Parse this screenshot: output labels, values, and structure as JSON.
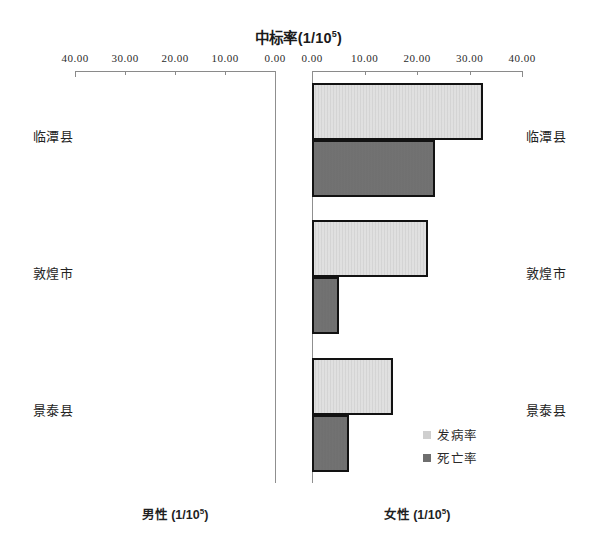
{
  "chart_data": {
    "type": "bar",
    "orientation": "horizontal",
    "layout": "back-to-back population pyramid (two mirrored panels)",
    "title_plain": "中标率(1/10^5)",
    "xlabel_left": "男性 (1/10⁵)",
    "xlabel_right": "女性 (1/10⁵)",
    "ylabel": "",
    "categories": [
      "临潭县",
      "敦煌市",
      "景泰县"
    ],
    "legend": [
      "发病率",
      "死亡率"
    ],
    "legend_position": "inside right, lower area",
    "grid": false,
    "xlim_left": [
      40.0,
      0.0
    ],
    "xlim_right": [
      0.0,
      40.0
    ],
    "tick_labels_left": [
      "40.00",
      "30.00",
      "20.00",
      "10.00",
      "0.00"
    ],
    "tick_labels_right": [
      "0.00",
      "10.00",
      "20.00",
      "30.00",
      "40.00"
    ],
    "tick_values": [
      0,
      10,
      20,
      30,
      40
    ],
    "panels": [
      {
        "name": "男性",
        "series": [
          {
            "name": "发病率",
            "values": [
              0,
              0,
              0
            ]
          },
          {
            "name": "死亡率",
            "values": [
              0,
              0,
              0
            ]
          }
        ]
      },
      {
        "name": "女性",
        "series": [
          {
            "name": "发病率",
            "values": [
              32.5,
              22.0,
              15.4
            ]
          },
          {
            "name": "死亡率",
            "values": [
              23.5,
              5.1,
              7.0
            ]
          }
        ]
      }
    ]
  },
  "title": {
    "main": "中标率(1/10",
    "sup": "5",
    "tail": ")"
  },
  "captions": {
    "left": {
      "text": "男性  (1/10",
      "sup": "5",
      "tail": ")"
    },
    "right": {
      "text": "女性  (1/10",
      "sup": "5",
      "tail": ")"
    }
  },
  "legend": {
    "items": [
      {
        "label": "发病率",
        "color": "#cfcfcf"
      },
      {
        "label": "死亡率",
        "color": "#6e6e6e"
      }
    ]
  },
  "colors": {
    "incidence": "#d4d4d4",
    "mortality": "#6e6e6e",
    "outline": "#121212",
    "axis": "#8a8a8a",
    "text": "#1a1a1a",
    "background": "#ffffff"
  }
}
